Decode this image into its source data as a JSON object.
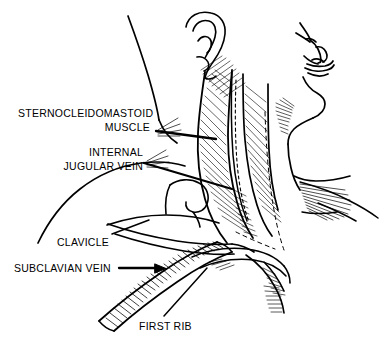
{
  "figure": {
    "type": "medical-line-illustration",
    "orientation": "lateral right profile view of head, neck and shoulder",
    "background_color": "#ffffff",
    "ink_color": "#000000",
    "style": "black ink line drawing with hatched shading, no color fill"
  },
  "labels": [
    {
      "id": "sternocleidomastoid",
      "line1": "STERNOCLEIDOMASTOID",
      "line2": "MUSCLE",
      "align": "right",
      "x": 18,
      "y": 107,
      "leader": "thick straight line from right end of MUSCLE to the sternocleidomastoid muscle belly"
    },
    {
      "id": "internal-jugular-vein",
      "line1": "INTERNAL",
      "line2": "JUGULAR VEIN",
      "align": "right",
      "x": 57,
      "y": 146,
      "leader": "thick straight line angling down-right to the internal jugular vein deep to the muscle"
    },
    {
      "id": "clavicle",
      "line1": "CLAVICLE",
      "line2": "",
      "align": "left",
      "x": 57,
      "y": 236,
      "leader": "thin line angling up-right to the clavicle shaft"
    },
    {
      "id": "subclavian-vein",
      "line1": "SUBCLAVIAN VEIN",
      "line2": "",
      "align": "left",
      "x": 14,
      "y": 264,
      "leader": "thick arrow pointing right to the subclavian vein"
    },
    {
      "id": "first-rib",
      "line1": "FIRST RIB",
      "line2": "",
      "align": "left",
      "x": 139,
      "y": 320,
      "leader": "thin line angling up-right to the first rib"
    }
  ],
  "anatomy": {
    "structures": [
      "ear (auricle)",
      "facial profile with nose, lips and chin",
      "mandible / jawline",
      "sternocleidomastoid muscle",
      "internal jugular vein",
      "clavicle",
      "subclavian vein",
      "first rib",
      "trapezius / shoulder contour",
      "pectoral region"
    ],
    "annotation_guides": [
      "dashed line indicating deep vessel course behind the clavicle",
      "dashed line indicating the internal jugular vein course beneath the sternocleidomastoid"
    ]
  }
}
